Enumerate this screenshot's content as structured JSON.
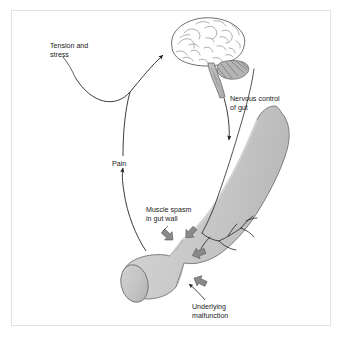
{
  "figure": {
    "type": "anatomical-diagram",
    "background_color": "#ffffff",
    "frame_color": "#e3e3e3",
    "text_color": "#1a1a1a",
    "gut_fill": "#c9c9c9",
    "gut_highlight": "#dcdcdc",
    "gut_outline": "#6e6e6e",
    "arrow_block_fill": "#8a8a8a",
    "arrow_block_outline": "#5a5a5a",
    "nerve_color": "#1a1a1a",
    "brain_outline": "#4a4a4a",
    "cerebellum_fill": "#b5b5b5"
  },
  "labels": {
    "tension": {
      "line1": "Tension and",
      "line2": "stress"
    },
    "nervous_control": {
      "line1": "Nervous control",
      "line2": "of gut"
    },
    "pain": {
      "line1": "Pain"
    },
    "muscle_spasm": {
      "line1": "Muscle spasm",
      "line2": "in gut wall"
    },
    "underlying": {
      "line1": "Underlying",
      "line2": "malfunction"
    }
  },
  "structures": {
    "brain": "brain-illustration",
    "brainstem": "brainstem",
    "cerebellum": "cerebellum",
    "gut": "gut-tube",
    "gut_constriction": "spasm-constriction",
    "gut_cut_end": "gut-cut-end",
    "nerve_branches": "nerve-branches"
  },
  "connectors": {
    "tension_to_brain": "arrow-up-to-brain",
    "brain_to_gut": "arrow-down-to-gut",
    "gut_to_pain": "arrow-up-pain",
    "leader_underlying": "leader-line-underlying",
    "leader_tension": "leader-line-tension",
    "leader_spasm": "leader-line-spasm"
  }
}
